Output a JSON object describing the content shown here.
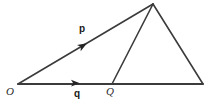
{
  "figure": {
    "name": "vector-triangle-diagram",
    "background_color": "#ffffff",
    "stroke_color": "#3b3b3b",
    "label_color": "#1a1a1a",
    "width": 213,
    "height": 108
  },
  "labels": {
    "vector_p": "p",
    "vector_q": "q",
    "point_O": "O",
    "point_Q": "Q"
  },
  "geometry": {
    "points": {
      "O": {
        "x": 18,
        "y": 84
      },
      "Q": {
        "x": 112,
        "y": 84
      },
      "apex": {
        "x": 153,
        "y": 4
      },
      "right_vertex": {
        "x": 203,
        "y": 84
      }
    },
    "segments": [
      {
        "name": "base-line-O-to-right-vertex",
        "x1": 18,
        "y1": 84,
        "x2": 203,
        "y2": 84
      },
      {
        "name": "ray-p-O-to-apex",
        "x1": 18,
        "y1": 84,
        "x2": 153,
        "y2": 4
      },
      {
        "name": "segment-Q-to-apex",
        "x1": 112,
        "y1": 84,
        "x2": 153,
        "y2": 4
      },
      {
        "name": "segment-apex-to-right-vertex",
        "x1": 153,
        "y1": 4,
        "x2": 203,
        "y2": 84
      }
    ],
    "arrowheads": [
      {
        "name": "arrowhead-p",
        "x": 86,
        "y": 44,
        "angle_deg": -30.6
      },
      {
        "name": "arrowhead-q",
        "x": 79,
        "y": 84,
        "angle_deg": 0
      }
    ]
  }
}
